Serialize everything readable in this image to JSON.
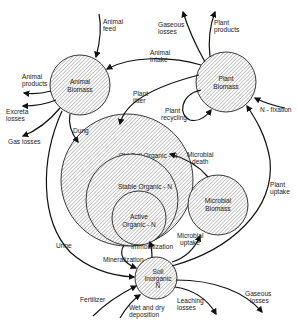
{
  "colors": {
    "line": "#111111",
    "hatch": "#555555",
    "background": "#ffffff"
  },
  "pools": {
    "animal_biomass": {
      "line1": "Animal",
      "line2": "Biomass"
    },
    "plant_biomass": {
      "line1": "Plant",
      "line2": "Biomass"
    },
    "old_soil_organic": {
      "label": "Old Soil Organic - N"
    },
    "stable_organic": {
      "label": "Stable Organic - N"
    },
    "active_organic": {
      "line1": "Active",
      "line2": "Organic - N"
    },
    "microbial_biomass": {
      "line1": "Microbial",
      "line2": "Biomass"
    },
    "soil_inorganic": {
      "line1": "Soil",
      "line2": "Inorganic",
      "line3": "N"
    }
  },
  "flows": {
    "animal_feed": {
      "line1": "Animal",
      "line2": "feed"
    },
    "animal_intake": {
      "line1": "Animal",
      "line2": "intake"
    },
    "gaseous_losses_top": {
      "line1": "Gaseous",
      "line2": "losses"
    },
    "plant_products": {
      "line1": "Plant",
      "line2": "products"
    },
    "animal_products": {
      "line1": "Animal",
      "line2": "products"
    },
    "excreta_losses": {
      "line1": "Excreta",
      "line2": "losses"
    },
    "gas_losses": {
      "label": "Gas losses"
    },
    "plant_litter": {
      "line1": "Plant",
      "line2": "litter"
    },
    "plant_recycling": {
      "line1": "Plant",
      "line2": "recycling"
    },
    "n_fixation": {
      "label": "N - fixation"
    },
    "dung": {
      "label": "Dung"
    },
    "microbial_death": {
      "line1": "Microbial",
      "line2": "death"
    },
    "plant_uptake": {
      "line1": "Plant",
      "line2": "uptake"
    },
    "immobilization": {
      "label": "Immobilization"
    },
    "microbial_uptake": {
      "line1": "Microbial",
      "line2": "uptake"
    },
    "urine": {
      "label": "Urine"
    },
    "mineralization": {
      "label": "Mineralization"
    },
    "fertilizer": {
      "label": "Fertilizer"
    },
    "wet_dry_deposition": {
      "line1": "Wet and dry",
      "line2": "deposition"
    },
    "leaching_losses": {
      "line1": "Leaching",
      "line2": "losses"
    },
    "gaseous_losses_bottom": {
      "line1": "Gaseous",
      "line2": "losses"
    }
  }
}
